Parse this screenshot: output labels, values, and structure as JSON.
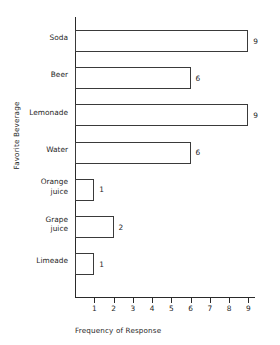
{
  "chart_data": {
    "type": "bar",
    "orientation": "horizontal",
    "title": "",
    "xlabel": "Frequency of Response",
    "ylabel": "Favorite Beverage",
    "categories": [
      "Soda",
      "Beer",
      "Lemonade",
      "Water",
      "Orange\njuice",
      "Grape\njuice",
      "Limeade"
    ],
    "values": [
      9,
      6,
      9,
      6,
      1,
      2,
      1
    ],
    "value_labels": [
      "9",
      "6",
      "9",
      "6",
      "1",
      "2",
      "1"
    ],
    "xticks": [
      1,
      2,
      3,
      4,
      5,
      6,
      7,
      8,
      9
    ],
    "xtick_labels": [
      "1",
      "2",
      "3",
      "4",
      "5",
      "6",
      "7",
      "8",
      "9"
    ],
    "xlim": [
      0,
      9.3
    ],
    "grid": false,
    "legend": null,
    "bar_facecolor": "#ffffff",
    "bar_edgecolor": "#3a3a3a",
    "axis_color": "#2a2a2a",
    "text_color": "#262626",
    "background": "#ffffff"
  }
}
